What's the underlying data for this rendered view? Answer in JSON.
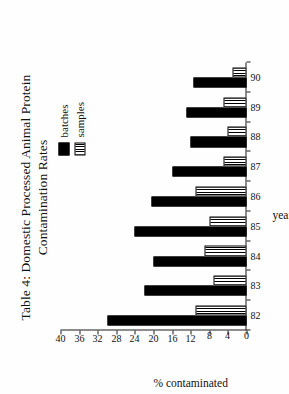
{
  "figure": {
    "title": "Table 4: Domestic Processed Animal Protein\nContamination Rates",
    "background_color": "#ffffff",
    "text_color": "#111111"
  },
  "legend": {
    "position": "top-right",
    "entries": [
      {
        "label": "batches",
        "swatch": "solid-black-swatch",
        "color": "#000000"
      },
      {
        "label": "samples",
        "swatch": "vertical-hatch-swatch",
        "color": "#ffffff"
      }
    ]
  },
  "chart_data": {
    "type": "bar",
    "orientation": "horizontal",
    "title": "Table 4: Domestic Processed Animal Protein Contamination Rates",
    "xlabel": "year",
    "ylabel": "% contaminated",
    "categories": [
      "82",
      "83",
      "84",
      "85",
      "86",
      "87",
      "88",
      "89",
      "90"
    ],
    "ylim": [
      0,
      40
    ],
    "yticks": [
      0,
      4,
      8,
      12,
      16,
      20,
      24,
      28,
      32,
      36,
      40
    ],
    "grid": false,
    "legend_position": "top-right",
    "series": [
      {
        "name": "batches",
        "values": [
          30,
          22,
          20,
          24,
          20.5,
          16,
          12,
          13,
          11.5
        ]
      },
      {
        "name": "samples",
        "values": [
          11,
          7,
          9,
          8,
          11,
          5,
          4,
          5,
          3
        ]
      }
    ]
  }
}
